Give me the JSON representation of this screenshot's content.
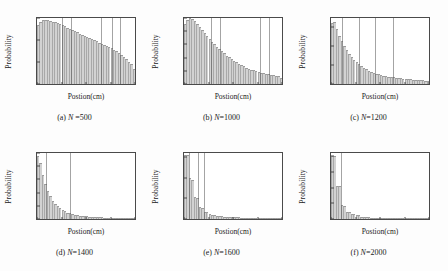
{
  "figure": {
    "axis_label_x": "Postion(cm)",
    "axis_label_y": "Probability"
  },
  "chart_data": [
    {
      "type": "bar",
      "panel": "a",
      "caption": "(a) N =500",
      "caption_prefix": "(a)",
      "caption_var": "N",
      "caption_value": " =500",
      "title": "",
      "xlabel": "Postion(cm)",
      "ylabel": "Probability",
      "xlim": [
        0,
        8
      ],
      "ylim": [
        0,
        0.075
      ],
      "xticks": [
        0,
        2,
        4,
        6,
        8
      ],
      "yticks": [
        0,
        0.025,
        0.05,
        0.075
      ],
      "ytick_labels": [
        "0",
        "0.025",
        "0.05",
        "0.075"
      ],
      "grid": false,
      "bin_width": 0.2,
      "x": [
        0.1,
        0.3,
        0.5,
        0.7,
        0.9,
        1.1,
        1.3,
        1.5,
        1.7,
        1.9,
        2.1,
        2.3,
        2.5,
        2.7,
        2.9,
        3.1,
        3.3,
        3.5,
        3.7,
        3.9,
        4.1,
        4.3,
        4.5,
        4.7,
        4.9,
        5.1,
        5.3,
        5.5,
        5.7,
        5.9,
        6.1,
        6.3,
        6.5,
        6.7,
        6.9,
        7.1,
        7.3,
        7.5,
        7.7,
        7.9
      ],
      "values": [
        0.0675,
        0.0705,
        0.0728,
        0.073,
        0.0726,
        0.0718,
        0.071,
        0.07,
        0.069,
        0.068,
        0.0668,
        0.0655,
        0.064,
        0.0628,
        0.0614,
        0.06,
        0.0586,
        0.0572,
        0.0558,
        0.0545,
        0.0532,
        0.052,
        0.0508,
        0.0496,
        0.0484,
        0.047,
        0.0458,
        0.0444,
        0.043,
        0.042,
        0.0406,
        0.0392,
        0.0372,
        0.0352,
        0.033,
        0.0306,
        0.0282,
        0.0254,
        0.0222,
        0.0168
      ],
      "stripes": [
        2.0,
        2.8,
        5.2,
        6.1,
        6.8
      ]
    },
    {
      "type": "bar",
      "panel": "b",
      "caption": "(b) N=1000",
      "caption_prefix": "(b)",
      "caption_var": "N",
      "caption_value": "=1000",
      "title": "",
      "xlabel": "Postion(cm)",
      "ylabel": "Probability",
      "xlim": [
        0,
        8
      ],
      "ylim": [
        0,
        0.125
      ],
      "xticks": [
        0,
        2,
        4,
        6,
        8
      ],
      "yticks": [
        0,
        0.025,
        0.05,
        0.075,
        0.1,
        0.125
      ],
      "ytick_labels": [
        "0",
        "0.025",
        "0.05",
        "0.075",
        "0.1",
        "0.125"
      ],
      "grid": false,
      "bin_width": 0.2,
      "x": [
        0.1,
        0.3,
        0.5,
        0.7,
        0.9,
        1.1,
        1.3,
        1.5,
        1.7,
        1.9,
        2.1,
        2.3,
        2.5,
        2.7,
        2.9,
        3.1,
        3.3,
        3.5,
        3.7,
        3.9,
        4.1,
        4.3,
        4.5,
        4.7,
        4.9,
        5.1,
        5.3,
        5.5,
        5.7,
        5.9,
        6.1,
        6.3,
        6.5,
        6.7,
        6.9,
        7.1,
        7.3,
        7.5,
        7.7,
        7.9
      ],
      "values": [
        0.114,
        0.1215,
        0.125,
        0.124,
        0.1195,
        0.114,
        0.108,
        0.102,
        0.096,
        0.0905,
        0.085,
        0.08,
        0.0752,
        0.0706,
        0.0662,
        0.062,
        0.058,
        0.054,
        0.0505,
        0.047,
        0.0438,
        0.0408,
        0.038,
        0.0355,
        0.0332,
        0.031,
        0.029,
        0.0272,
        0.0256,
        0.0242,
        0.0228,
        0.0215,
        0.0204,
        0.0193,
        0.0183,
        0.0173,
        0.0164,
        0.0155,
        0.0146,
        0.012
      ],
      "stripes": [
        2.2,
        2.9,
        6.2,
        6.9
      ]
    },
    {
      "type": "bar",
      "panel": "c",
      "caption": "(c) N=1200",
      "caption_prefix": "(c)",
      "caption_var": "N",
      "caption_value": "=1200",
      "title": "",
      "xlabel": "Postion(cm)",
      "ylabel": "Probability",
      "xlim": [
        0,
        8
      ],
      "ylim": [
        0,
        0.175
      ],
      "xticks": [
        0,
        2,
        4,
        6,
        8
      ],
      "yticks": [
        0,
        0.05,
        0.1,
        0.15
      ],
      "ytick_labels": [
        "0",
        "0.05",
        "0.1",
        "0.15"
      ],
      "grid": false,
      "bin_width": 0.2,
      "x": [
        0.1,
        0.3,
        0.5,
        0.7,
        0.9,
        1.1,
        1.3,
        1.5,
        1.7,
        1.9,
        2.1,
        2.3,
        2.5,
        2.7,
        2.9,
        3.1,
        3.3,
        3.5,
        3.7,
        3.9,
        4.1,
        4.3,
        4.5,
        4.7,
        4.9,
        5.1,
        5.3,
        5.5,
        5.7,
        5.9,
        6.1,
        6.3,
        6.5,
        6.7,
        6.9,
        7.1,
        7.3,
        7.5,
        7.7,
        7.9
      ],
      "values": [
        0.162,
        0.164,
        0.145,
        0.127,
        0.113,
        0.101,
        0.09,
        0.08,
        0.0715,
        0.064,
        0.0575,
        0.052,
        0.047,
        0.0425,
        0.039,
        0.0355,
        0.0325,
        0.03,
        0.0278,
        0.0258,
        0.024,
        0.0224,
        0.021,
        0.0198,
        0.0186,
        0.0176,
        0.0166,
        0.0158,
        0.015,
        0.0143,
        0.0136,
        0.013,
        0.0124,
        0.0118,
        0.0112,
        0.0107,
        0.0102,
        0.0097,
        0.0092,
        0.0075
      ],
      "stripes": [
        0.9,
        2.3,
        3.6,
        5.1
      ]
    },
    {
      "type": "bar",
      "panel": "d",
      "caption": "(d) N=1400",
      "caption_prefix": "(d)",
      "caption_var": "N",
      "caption_value": "=1400",
      "title": "",
      "xlabel": "Postion(cm)",
      "ylabel": "Probability",
      "xlim": [
        0,
        8
      ],
      "ylim": [
        0,
        0.25
      ],
      "xticks": [
        0,
        2,
        4,
        6,
        8
      ],
      "yticks": [
        0,
        0.05,
        0.1,
        0.15,
        0.2,
        0.25
      ],
      "ytick_labels": [
        "0",
        "0.05",
        "0.1",
        "0.15",
        "0.2",
        "0.25"
      ],
      "grid": false,
      "bin_width": 0.2,
      "x": [
        0.1,
        0.3,
        0.5,
        0.7,
        0.9,
        1.1,
        1.3,
        1.5,
        1.7,
        1.9,
        2.1,
        2.3,
        2.5,
        2.7,
        2.9,
        3.1,
        3.3,
        3.5,
        3.7,
        3.9,
        4.1,
        4.3,
        4.5,
        4.7,
        4.9,
        5.1,
        5.3,
        5.5,
        5.7,
        5.9,
        6.1,
        6.3,
        6.5,
        6.7,
        6.9,
        7.1,
        7.3,
        7.5,
        7.7,
        7.9
      ],
      "values": [
        0.24,
        0.214,
        0.168,
        0.132,
        0.106,
        0.086,
        0.07,
        0.0575,
        0.048,
        0.04,
        0.0335,
        0.0285,
        0.0245,
        0.0212,
        0.0185,
        0.0163,
        0.0145,
        0.013,
        0.0117,
        0.0106,
        0.0096,
        0.0088,
        0.0081,
        0.0075,
        0.0069,
        0.0064,
        0.006,
        0.0056,
        0.0052,
        0.0049,
        0.0046,
        0.0043,
        0.004,
        0.0038,
        0.0036,
        0.0034,
        0.0032,
        0.003,
        0.0028,
        0.0022
      ],
      "stripes": [
        0.75,
        2.7
      ]
    },
    {
      "type": "bar",
      "panel": "e",
      "caption": "(e) N=1600",
      "caption_prefix": "(e)",
      "caption_var": "N",
      "caption_value": "=1600",
      "title": "",
      "xlabel": "Postion(cm)",
      "ylabel": "Probability",
      "xlim": [
        0,
        8
      ],
      "ylim": [
        0,
        0.32
      ],
      "xticks": [
        0,
        2,
        4,
        6,
        8
      ],
      "yticks": [
        0,
        0.1,
        0.2,
        0.3
      ],
      "ytick_labels": [
        "0",
        "0.1",
        "0.2",
        "0.3"
      ],
      "grid": false,
      "bin_width": 0.2,
      "x": [
        0.1,
        0.3,
        0.5,
        0.7,
        0.9,
        1.1,
        1.3,
        1.5,
        1.7,
        1.9,
        2.1,
        2.3,
        2.5,
        2.7,
        2.9,
        3.1,
        3.3,
        3.5,
        3.7,
        3.9,
        4.1,
        4.3,
        4.5,
        4.7,
        4.9,
        5.1,
        5.3,
        5.5,
        5.7,
        5.9,
        6.1,
        6.3,
        6.5,
        6.7,
        6.9,
        7.1,
        7.3,
        7.5,
        7.7,
        7.9
      ],
      "values": [
        0.31,
        0.308,
        0.2,
        0.19,
        0.108,
        0.102,
        0.056,
        0.053,
        0.034,
        0.032,
        0.023,
        0.0215,
        0.0175,
        0.0165,
        0.014,
        0.0132,
        0.0118,
        0.0112,
        0.01,
        0.0095,
        0.0086,
        0.0082,
        0.0075,
        0.0071,
        0.0066,
        0.0062,
        0.0058,
        0.0055,
        0.0051,
        0.0048,
        0.0045,
        0.0043,
        0.004,
        0.0038,
        0.0036,
        0.0034,
        0.0032,
        0.003,
        0.0028,
        0.0022
      ],
      "stripes": [
        0.42,
        1.15,
        1.6
      ]
    },
    {
      "type": "bar",
      "panel": "f",
      "caption": "(f) N=2000",
      "caption_prefix": "(f)",
      "caption_var": "N",
      "caption_value": "=2000",
      "title": "",
      "xlabel": "Postion(cm)",
      "ylabel": "Probability",
      "xlim": [
        0,
        8
      ],
      "ylim": [
        0,
        0.42
      ],
      "xticks": [
        0,
        2,
        4,
        6,
        8
      ],
      "yticks": [
        0,
        0.1,
        0.2,
        0.3,
        0.4
      ],
      "ytick_labels": [
        "0",
        "0.1",
        "0.2",
        "0.3",
        "0.4"
      ],
      "grid": false,
      "bin_width": 0.2,
      "x": [
        0.1,
        0.3,
        0.5,
        0.7,
        0.9,
        1.1,
        1.3,
        1.5,
        1.7,
        1.9,
        2.1,
        2.3,
        2.5,
        2.7,
        2.9,
        3.1,
        3.3,
        3.5,
        3.7,
        3.9,
        4.1,
        4.3,
        4.5,
        4.7,
        4.9,
        5.1,
        5.3,
        5.5,
        5.7,
        5.9,
        6.1,
        6.3,
        6.5,
        6.7,
        6.9,
        7.1,
        7.3,
        7.5,
        7.7,
        7.9
      ],
      "values": [
        0.402,
        0.4,
        0.212,
        0.21,
        0.088,
        0.086,
        0.047,
        0.0455,
        0.033,
        0.032,
        0.0245,
        0.0238,
        0.015,
        0.0145,
        0.0115,
        0.011,
        0.0095,
        0.009,
        0.008,
        0.0076,
        0.0068,
        0.0064,
        0.0058,
        0.0055,
        0.005,
        0.0047,
        0.0044,
        0.0041,
        0.0038,
        0.0036,
        0.0034,
        0.0032,
        0.003,
        0.0028,
        0.0026,
        0.0025,
        0.0023,
        0.0022,
        0.002,
        0.0016
      ],
      "stripes": [
        0.8
      ]
    }
  ]
}
